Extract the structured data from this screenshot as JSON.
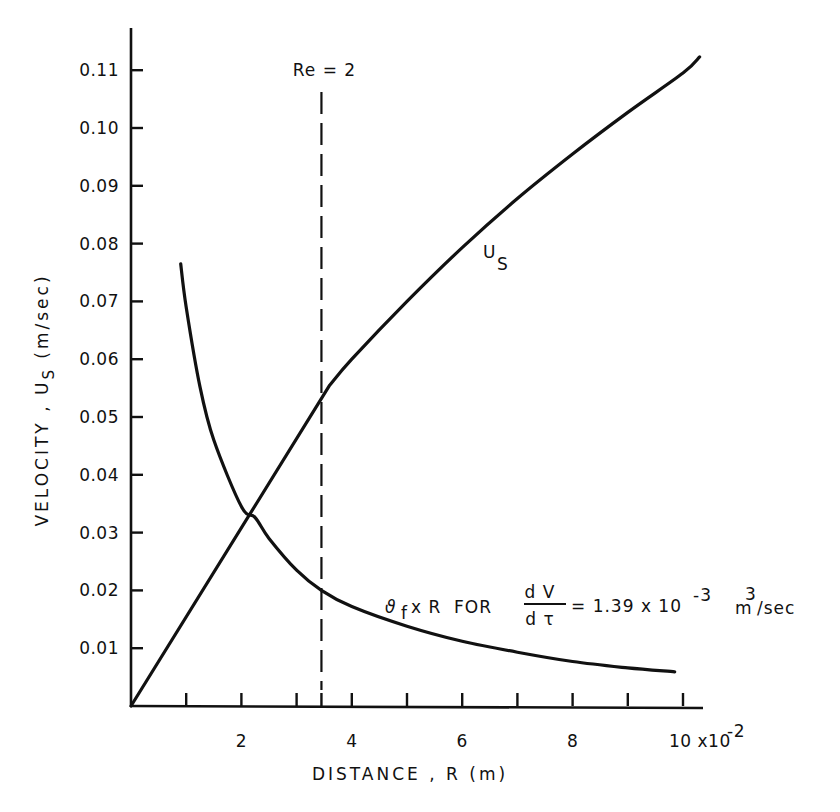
{
  "chart_data": {
    "type": "line",
    "title": "",
    "xlabel": "DISTANCE , R (m)",
    "ylabel": "VELOCITY , U_S (m/sec)",
    "x_scale_note": "x10^-2",
    "xlim": [
      0,
      10.4
    ],
    "ylim": [
      0,
      0.118
    ],
    "x_ticks": [
      1,
      2,
      3,
      4,
      5,
      6,
      7,
      8,
      9,
      10
    ],
    "x_tick_labels": [
      {
        "x": 2,
        "label": "2"
      },
      {
        "x": 4,
        "label": "4"
      },
      {
        "x": 6,
        "label": "6"
      },
      {
        "x": 8,
        "label": "8"
      },
      {
        "x": 10,
        "label": "10 x10"
      }
    ],
    "x_exponent": "-2",
    "y_ticks": [
      0.01,
      0.02,
      0.03,
      0.04,
      0.05,
      0.06,
      0.07,
      0.08,
      0.09,
      0.1,
      0.11
    ],
    "y_tick_labels": [
      "0.01",
      "0.02",
      "0.03",
      "0.04",
      "0.05",
      "0.06",
      "0.07",
      "0.08",
      "0.09",
      "0.10",
      "0.11"
    ],
    "grid": false,
    "legend": null,
    "series": [
      {
        "name": "U_S",
        "label_main": "U",
        "label_sub": "S",
        "x": [
          0,
          1,
          2,
          3,
          3.6,
          4,
          5,
          6,
          7,
          8,
          9,
          10,
          10.3
        ],
        "values": [
          0,
          0.015,
          0.03,
          0.045,
          0.0555,
          0.06,
          0.07,
          0.0793,
          0.0878,
          0.0955,
          0.1027,
          0.1095,
          0.1123
        ]
      },
      {
        "name": "theta_f x R for dV/dtau = 1.39x10^-3 m^3/sec",
        "x": [
          0.9,
          1.0,
          1.25,
          1.5,
          2.0,
          2.25,
          2.5,
          3.0,
          3.45,
          4.0,
          5.0,
          6.0,
          7.0,
          8.0,
          9.0,
          9.85
        ],
        "values": [
          0.0765,
          0.069,
          0.0552,
          0.046,
          0.0345,
          0.0326,
          0.029,
          0.0235,
          0.02,
          0.0172,
          0.0138,
          0.0112,
          0.0093,
          0.0077,
          0.0066,
          0.0059
        ]
      }
    ],
    "annotations": [
      {
        "type": "vline",
        "x": 3.45,
        "style": "dashed",
        "label": "Re = 2"
      },
      {
        "type": "text",
        "series_label_prefix": "ϑ",
        "series_label_sub": "f",
        "series_label_mid": "x R  FOR",
        "fraction_num": "d V",
        "fraction_den": "d τ",
        "equals_text": "= 1.39 x 10",
        "exponent": "-3",
        "unit_main": "m",
        "unit_sup": "3",
        "unit_rest": "/sec"
      }
    ]
  }
}
